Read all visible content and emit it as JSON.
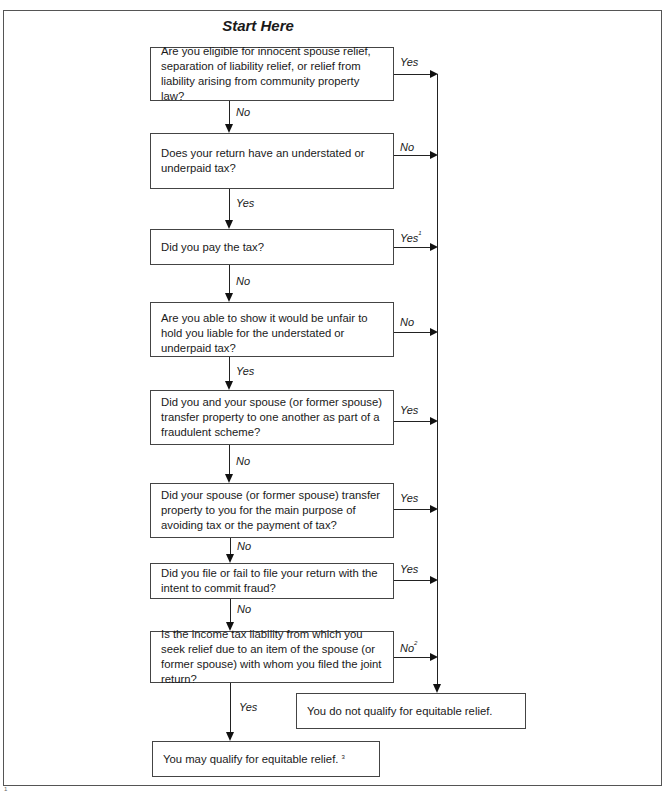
{
  "title": "Start Here",
  "questions": [
    {
      "id": 1,
      "text": "Are you eligible for innocent spouse relief, separation of liability relief, or relief from liability arising from community property law?",
      "right_label": "Yes",
      "right_sup": "",
      "down_label": "No"
    },
    {
      "id": 2,
      "text": "Does your return have an understated or underpaid tax?",
      "right_label": "No",
      "right_sup": "",
      "down_label": "Yes"
    },
    {
      "id": 3,
      "text": "Did you pay the tax?",
      "right_label": "Yes",
      "right_sup": "1",
      "down_label": "No"
    },
    {
      "id": 4,
      "text": "Are you able to show it would be unfair to hold you liable for the understated or underpaid tax?",
      "right_label": "No",
      "right_sup": "",
      "down_label": "Yes"
    },
    {
      "id": 5,
      "text": "Did you and your spouse (or former spouse) transfer property to one another as part of a fraudulent scheme?",
      "right_label": "Yes",
      "right_sup": "",
      "down_label": "No"
    },
    {
      "id": 6,
      "text": "Did your spouse (or former spouse) transfer property to you for the main purpose of avoiding tax or the payment of tax?",
      "right_label": "Yes",
      "right_sup": "",
      "down_label": "No"
    },
    {
      "id": 7,
      "text": "Did you file or fail to file your return with the intent to commit fraud?",
      "right_label": "Yes",
      "right_sup": "",
      "down_label": "No"
    },
    {
      "id": 8,
      "text": "Is the income tax liability from which you seek relief due to an item of the spouse (or former spouse) with whom you filed the joint return?",
      "right_label": "No",
      "right_sup": "2",
      "down_label": "Yes"
    }
  ],
  "outcomes": {
    "not_qualify": "You do not qualify for equitable relief.",
    "may_qualify": "You may qualify for equitable relief.",
    "may_qualify_sup": "3"
  },
  "footnote_marker": "1"
}
